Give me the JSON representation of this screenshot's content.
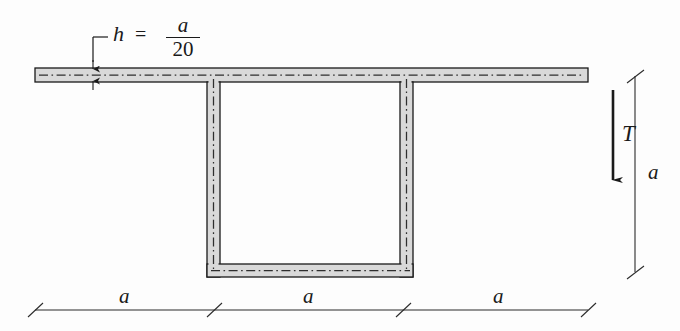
{
  "figure": {
    "type": "engineering-cross-section-diagram",
    "colors": {
      "line": "#1a1a1a",
      "wall_fill": "#d8d8d8",
      "centerline": "#3a3a3a",
      "background": "#fdfdfd",
      "dimension": "#2b2b2b"
    }
  },
  "labels": {
    "thickness_callout": {
      "symbol": "h",
      "equals": "=",
      "numerator": "a",
      "denominator": "20",
      "full_text": "h = a/20"
    },
    "torque": "T",
    "vertical_dimension": "a",
    "bottom_dimensions": [
      "a",
      "a",
      "a"
    ]
  },
  "geometry": {
    "flange": {
      "x1": 35,
      "x2": 588,
      "y1": 68,
      "y2": 82,
      "thickness": 14
    },
    "left_web": {
      "x1": 207,
      "x2": 220,
      "y1": 68,
      "y2": 277
    },
    "right_web": {
      "x1": 400,
      "x2": 413,
      "y1": 68,
      "y2": 277
    },
    "bottom_flange": {
      "x1": 207,
      "x2": 413,
      "y1": 264,
      "y2": 277
    },
    "torque_arrow": {
      "x": 613,
      "y_start": 90,
      "y_end": 192,
      "direction": "down"
    },
    "vertical_dim_line": {
      "x": 635,
      "y_top": 76,
      "y_bottom": 272
    },
    "bottom_dim_line": {
      "y": 310,
      "ticks": [
        35,
        214,
        403,
        588
      ]
    }
  }
}
